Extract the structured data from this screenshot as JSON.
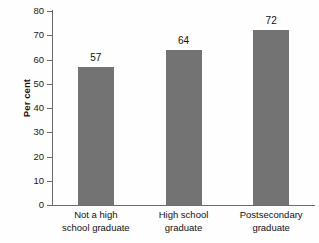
{
  "chart_data": {
    "type": "bar",
    "title": "",
    "xlabel": "",
    "ylabel": "Per cent",
    "ylim": [
      0,
      80
    ],
    "ytick_step": 10,
    "yticks": [
      "80",
      "70",
      "60",
      "50",
      "40",
      "30",
      "20",
      "10",
      "0"
    ],
    "grid": false,
    "legend": "none",
    "bar_color": "#737373",
    "axis_color": "#6b6b6b",
    "background": "#fefefe",
    "categories": [
      "Not a high school graduate",
      "High school graduate",
      "Postsecondary graduate"
    ],
    "category_lines": [
      [
        "Not a high",
        "school graduate"
      ],
      [
        "High school",
        "graduate"
      ],
      [
        "Postsecondary",
        "graduate"
      ]
    ],
    "values": [
      57,
      64,
      72
    ],
    "value_labels": [
      "57",
      "64",
      "72"
    ]
  }
}
